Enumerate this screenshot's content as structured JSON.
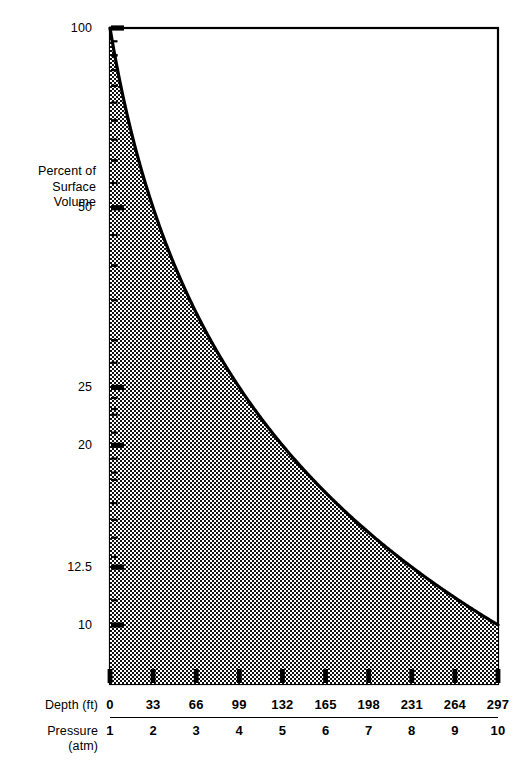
{
  "chart_data": {
    "type": "area",
    "title": "",
    "subtitle": "",
    "ylabel": "Percent of Surface Volume",
    "xlabel": "Depth (ft)",
    "xlabel2": "Pressure (atm)",
    "yscale": "log",
    "ylim": [
      10,
      100
    ],
    "ytick_labels": [
      "100",
      "50",
      "25",
      "20",
      "12.5",
      "10"
    ],
    "ytick_values": [
      100,
      50,
      25,
      20,
      12.5,
      10
    ],
    "xlim": [
      0,
      297
    ],
    "x_depth_ticks": [
      "0",
      "33",
      "66",
      "99",
      "132",
      "165",
      "198",
      "231",
      "264",
      "297"
    ],
    "x_pressure_ticks": [
      "1",
      "2",
      "3",
      "4",
      "5",
      "6",
      "7",
      "8",
      "9",
      "10"
    ],
    "series": [
      {
        "name": "Percent of Surface Volume",
        "x_pressure": [
          1,
          1.5,
          2,
          2.5,
          3,
          3.5,
          4,
          4.5,
          5,
          5.5,
          6,
          6.5,
          7,
          7.5,
          8,
          8.5,
          9,
          9.5,
          10
        ],
        "x_depth": [
          0,
          16.5,
          33,
          49.5,
          66,
          82.5,
          99,
          115.5,
          132,
          148.5,
          165,
          181.5,
          198,
          214.5,
          231,
          247.5,
          264,
          280.5,
          297
        ],
        "values": [
          100,
          66.7,
          50,
          40,
          33.3,
          28.6,
          25,
          22.2,
          20,
          18.2,
          16.7,
          15.4,
          14.3,
          13.3,
          12.5,
          11.8,
          11.1,
          10.5,
          10
        ]
      }
    ],
    "fill": "crosshatch",
    "grid": false,
    "legend": "none",
    "line_color": "#000000",
    "fill_color": "#000000",
    "background_color": "#ffffff",
    "relation": "volume = 100 / pressure (Boyle's Law)"
  },
  "axis": {
    "y_title_lines": [
      "Percent of",
      "Surface",
      "Volume"
    ],
    "row_labels": {
      "depth": "Depth (ft)",
      "pressure_line1": "Pressure",
      "pressure_line2": "(atm)"
    }
  }
}
